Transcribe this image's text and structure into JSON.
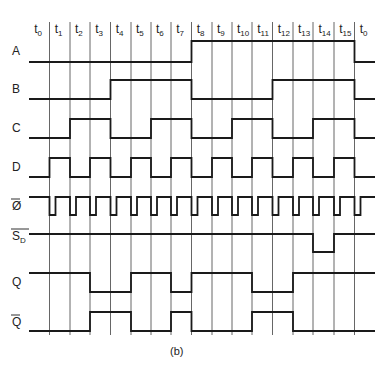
{
  "figure": {
    "caption": "(b)",
    "time_labels": [
      "t0",
      "t1",
      "t2",
      "t3",
      "t4",
      "t5",
      "t6",
      "t7",
      "t8",
      "t9",
      "t10",
      "t11",
      "t12",
      "t13",
      "t14",
      "t15",
      "t0"
    ],
    "signals": [
      {
        "name": "A",
        "label": "A",
        "overbar": false,
        "levels": [
          0,
          0,
          0,
          0,
          0,
          0,
          0,
          0,
          1,
          1,
          1,
          1,
          1,
          1,
          1,
          1,
          0
        ]
      },
      {
        "name": "B",
        "label": "B",
        "overbar": false,
        "levels": [
          0,
          0,
          0,
          0,
          1,
          1,
          1,
          1,
          0,
          0,
          0,
          0,
          1,
          1,
          1,
          1,
          0
        ]
      },
      {
        "name": "C",
        "label": "C",
        "overbar": false,
        "levels": [
          0,
          0,
          1,
          1,
          0,
          0,
          1,
          1,
          0,
          0,
          1,
          1,
          0,
          0,
          1,
          1,
          0
        ]
      },
      {
        "name": "D",
        "label": "D",
        "overbar": false,
        "levels": [
          0,
          1,
          0,
          1,
          0,
          1,
          0,
          1,
          0,
          1,
          0,
          1,
          0,
          1,
          0,
          1,
          0
        ]
      },
      {
        "name": "clock-bar",
        "label": "Ø",
        "overbar": true,
        "pulse": "active-low pulse at start of each interval"
      },
      {
        "name": "SD-bar",
        "label": "S",
        "subscript": "D",
        "overbar": true,
        "levels": [
          1,
          1,
          1,
          1,
          1,
          1,
          1,
          1,
          1,
          1,
          1,
          1,
          1,
          1,
          0,
          1,
          1
        ]
      },
      {
        "name": "Q",
        "label": "Q",
        "overbar": false,
        "levels": [
          1,
          1,
          1,
          0,
          0,
          1,
          1,
          0,
          1,
          1,
          1,
          0,
          0,
          1,
          1,
          1,
          1
        ]
      },
      {
        "name": "Q-bar",
        "label": "Q",
        "overbar": true,
        "levels": [
          0,
          0,
          0,
          1,
          1,
          0,
          0,
          1,
          0,
          0,
          0,
          1,
          1,
          0,
          0,
          0,
          0
        ]
      }
    ]
  },
  "colors": {
    "line": "#1a1a1a",
    "grid": "#555555",
    "background": "#ffffff"
  }
}
